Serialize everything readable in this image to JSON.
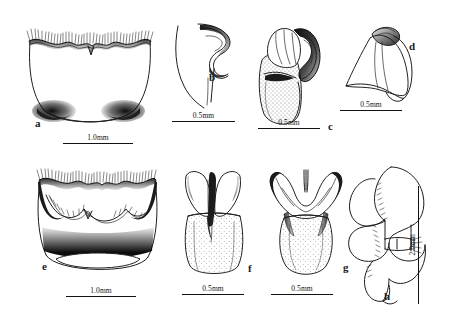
{
  "figure": {
    "background_color": "#ffffff",
    "ink_color": "#1d1d1d",
    "width_px": 451,
    "height_px": 330
  },
  "panels": [
    {
      "id": "a",
      "label": "a",
      "scale_text": "1.0mm",
      "scale_orientation": "horizontal",
      "description": "Male subgenital plate, ventral view, with setose posterior margin and dark lateral patches"
    },
    {
      "id": "b",
      "label": "b",
      "scale_text": "0.5mm",
      "scale_orientation": "horizontal",
      "description": "Lateral outline of genital capsule with hooked apical process"
    },
    {
      "id": "c",
      "label": "c",
      "scale_text": "0.5mm",
      "scale_orientation": "horizontal",
      "description": "Aedeagus, lateral view, with stippled basal body and sclerotized apical hook"
    },
    {
      "id": "d",
      "label": "d",
      "scale_text": "0.5mm",
      "scale_orientation": "horizontal",
      "description": "Paramere, lateral view, with apical knob"
    },
    {
      "id": "e",
      "label": "e",
      "scale_text": "1.0mm",
      "scale_orientation": "horizontal",
      "description": "Male subgenital plate, ventral view, with toothed inner margin and dark band"
    },
    {
      "id": "f",
      "label": "f",
      "scale_text": "0.5mm",
      "scale_orientation": "horizontal",
      "description": "Aedeagus, ventral view, with elongate dark median sclerite"
    },
    {
      "id": "g",
      "label": "g",
      "scale_text": "0.5mm",
      "scale_orientation": "horizontal",
      "description": "Aedeagus, ventral view, with short median process and paired dark patches"
    },
    {
      "id": "h",
      "label": "h",
      "scale_text": "2.0mm",
      "scale_orientation": "vertical",
      "description": "Abdominal segments, lateral view, with setose sutures"
    }
  ]
}
